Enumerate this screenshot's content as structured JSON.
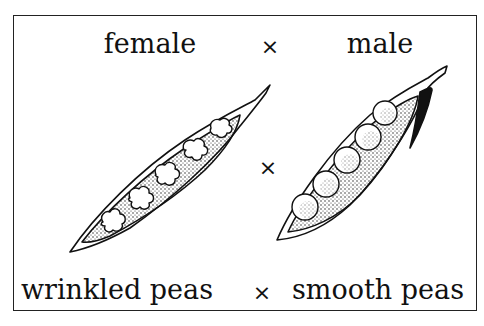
{
  "figure": {
    "top_row": {
      "left_label": "female",
      "cross_symbol": "×",
      "right_label": "male"
    },
    "middle_cross_symbol": "×",
    "bottom_row": {
      "left_label": "wrinkled peas",
      "cross_symbol": "×",
      "right_label": "smooth peas"
    },
    "pods": [
      {
        "name": "female-pod",
        "seed_type": "wrinkled",
        "seed_count": 5
      },
      {
        "name": "male-pod",
        "seed_type": "smooth",
        "seed_count": 5
      }
    ],
    "colors": {
      "ink": "#111111",
      "background": "#ffffff"
    }
  }
}
